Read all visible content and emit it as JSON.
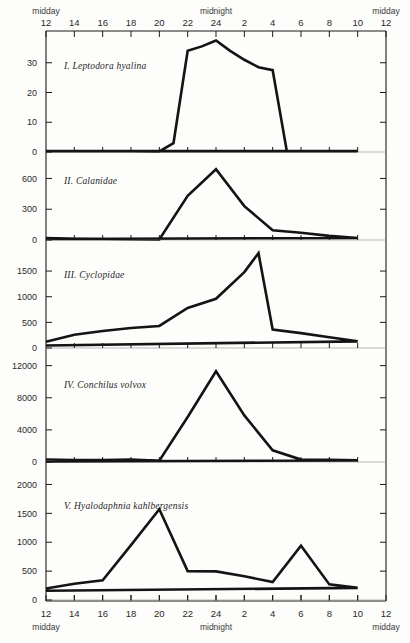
{
  "figure": {
    "background_color": "#fdfdfb",
    "line_color": "#141414",
    "axis_color": "#1a1a1a"
  },
  "axis": {
    "top": {
      "left_daypart": "midday",
      "center_daypart": "midnight",
      "right_daypart": "midday",
      "hour_labels": [
        "12",
        "14",
        "16",
        "18",
        "20",
        "22",
        "24",
        "2",
        "4",
        "6",
        "8",
        "10",
        "12"
      ]
    },
    "bottom": {
      "left_daypart": "midday",
      "center_daypart": "midnight",
      "right_daypart": "midday",
      "hour_labels": [
        "12",
        "14",
        "16",
        "18",
        "20",
        "22",
        "24",
        "2",
        "4",
        "6",
        "8",
        "10",
        "12"
      ]
    }
  },
  "chart_data": [
    {
      "type": "line",
      "panel": "I",
      "title": "I. Leptodora hyalina",
      "xlabel": "",
      "ylabel": "",
      "x": [
        12,
        14,
        16,
        18,
        20,
        21,
        22,
        23,
        24,
        1,
        2,
        3,
        4,
        5,
        6,
        8,
        10,
        12
      ],
      "values": [
        0.3,
        0.3,
        0.3,
        0.3,
        0.2,
        3.0,
        34.0,
        35.5,
        37.5,
        34.0,
        31.0,
        28.5,
        27.5,
        0.3,
        0.3,
        0.3,
        0.3,
        0.3
      ],
      "ytick_labels": [
        "0",
        "10",
        "20",
        "30"
      ],
      "ytick_values": [
        0,
        10,
        20,
        30
      ],
      "ylim": [
        0,
        40
      ],
      "grid": false
    },
    {
      "type": "line",
      "panel": "II",
      "title": "II. Calanidae",
      "xlabel": "",
      "ylabel": "",
      "x": [
        12,
        14,
        16,
        18,
        20,
        22,
        24,
        2,
        4,
        6,
        8,
        10,
        12
      ],
      "values": [
        20,
        12,
        10,
        8,
        5,
        430,
        690,
        330,
        95,
        70,
        40,
        20,
        10
      ],
      "ytick_labels": [
        "0",
        "300",
        "600"
      ],
      "ytick_values": [
        0,
        300,
        600
      ],
      "ylim": [
        0,
        780
      ],
      "grid": false
    },
    {
      "type": "line",
      "panel": "III",
      "title": "III. Cyclopidae",
      "xlabel": "",
      "ylabel": "",
      "x": [
        12,
        14,
        16,
        18,
        20,
        22,
        24,
        2,
        3,
        4,
        6,
        8,
        10,
        12
      ],
      "values": [
        120,
        260,
        330,
        390,
        430,
        780,
        960,
        1480,
        1850,
        360,
        290,
        210,
        130,
        50
      ],
      "ytick_labels": [
        "0",
        "500",
        "1000",
        "1500"
      ],
      "ytick_values": [
        0,
        500,
        1000,
        1500
      ],
      "ylim": [
        0,
        1950
      ],
      "grid": false
    },
    {
      "type": "line",
      "panel": "IV",
      "title": "IV. Conchilus volvox",
      "xlabel": "",
      "ylabel": "",
      "x": [
        12,
        14,
        16,
        18,
        20,
        22,
        24,
        2,
        4,
        6,
        8,
        10,
        12
      ],
      "values": [
        320,
        250,
        230,
        300,
        160,
        5600,
        11300,
        5800,
        1450,
        300,
        280,
        200,
        60
      ],
      "ytick_labels": [
        "0",
        "4000",
        "8000",
        "12000"
      ],
      "ytick_values": [
        0,
        4000,
        8000,
        12000
      ],
      "ylim": [
        0,
        13200
      ],
      "grid": false
    },
    {
      "type": "line",
      "panel": "V",
      "title": "V. Hyalodaphnia kahlbergensis",
      "xlabel": "",
      "ylabel": "",
      "x": [
        12,
        14,
        16,
        18,
        20,
        22,
        24,
        2,
        4,
        6,
        8,
        10,
        12
      ],
      "values": [
        200,
        280,
        340,
        950,
        1570,
        500,
        495,
        410,
        310,
        940,
        270,
        210,
        160
      ],
      "ytick_labels": [
        "0",
        "500",
        "1000",
        "1500",
        "2000"
      ],
      "ytick_values": [
        0,
        500,
        1000,
        1500,
        2000
      ],
      "ylim": [
        0,
        2250
      ],
      "grid": false
    }
  ]
}
